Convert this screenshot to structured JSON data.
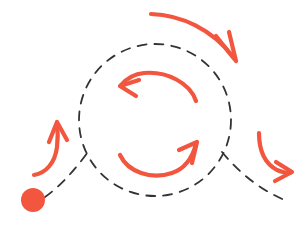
{
  "canvas": {
    "width": 308,
    "height": 231,
    "background_color": "#ffffff",
    "title": "cyclic-process-loop-diagram"
  },
  "style": {
    "accent_color": "#f2563f",
    "accent_color_light": "#f4694f",
    "dash_color": "#333333",
    "dash_pattern": "9 8",
    "dash_stroke_width": 1.8,
    "arrow_stroke_width": 4.2
  },
  "shapes": {
    "loop_circle": {
      "name": "dashed-loop-circle",
      "center_x": 155,
      "center_y": 120,
      "radius": 76,
      "stroke": "dashed"
    },
    "start_dot": {
      "name": "start-node-dot",
      "center_x": 33,
      "center_y": 200,
      "radius": 12,
      "fill": "#f2563f"
    },
    "entry_line": {
      "name": "entry-dashed-line",
      "from_x": 45,
      "from_y": 196,
      "to_x": 88,
      "to_y": 152
    },
    "exit_line": {
      "name": "exit-dashed-line",
      "from_x": 223,
      "from_y": 152,
      "to_x": 287,
      "to_y": 201
    }
  },
  "arrows": [
    {
      "id": "top-outer-arrow",
      "label": "top outer sweep arrow",
      "direction": "clockwise-down-right",
      "start_x": 152,
      "start_y": 14,
      "end_x": 236,
      "end_y": 60,
      "color": "#f2563f"
    },
    {
      "id": "inner-upper-arrow",
      "label": "inner upper counter-clockwise arrow",
      "direction": "counter-clockwise-left",
      "start_x": 196,
      "start_y": 100,
      "end_x": 122,
      "end_y": 84,
      "color": "#f2563f"
    },
    {
      "id": "inner-lower-arrow",
      "label": "inner lower counter-clockwise arrow",
      "direction": "counter-clockwise-right",
      "start_x": 120,
      "start_y": 156,
      "end_x": 196,
      "end_y": 142,
      "color": "#f2563f"
    },
    {
      "id": "left-outer-arrow",
      "label": "left outer rising arrow",
      "direction": "up",
      "start_x": 35,
      "start_y": 174,
      "end_x": 57,
      "end_y": 123,
      "color": "#f2563f"
    },
    {
      "id": "right-outer-arrow",
      "label": "right outer descending arrow",
      "direction": "down-right",
      "start_x": 259,
      "start_y": 133,
      "end_x": 291,
      "end_y": 172,
      "color": "#f2563f"
    }
  ]
}
